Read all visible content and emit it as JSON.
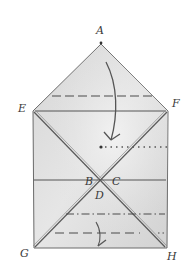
{
  "diagram": {
    "type": "paper-folding-diagram",
    "colors": {
      "paper_fill": "#e2e2e2",
      "paper_shade": "#cfcfcf",
      "ink": "#4a4a4a",
      "background": "#ffffff"
    },
    "labels": {
      "A": "A",
      "E": "E",
      "F": "F",
      "B": "B",
      "C": "C",
      "D": "D",
      "G": "G",
      "H": "H"
    },
    "points": {
      "A": [
        101,
        44
      ],
      "E": [
        34,
        111
      ],
      "F": [
        168,
        111
      ],
      "G": [
        34,
        248
      ],
      "H": [
        166,
        248
      ],
      "center": [
        101,
        180
      ]
    },
    "lines": {
      "upper_dashed_y": 96,
      "ef_solid_y": 111,
      "dotted_y": 147,
      "bc_solid_y": 180,
      "lower_dashdot_y": 214,
      "lower_dashed_y": 233
    }
  }
}
